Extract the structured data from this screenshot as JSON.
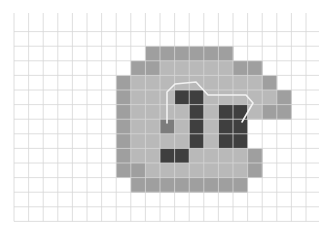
{
  "figure": {
    "grid": {
      "origin_x": 14,
      "origin_y": 17,
      "cell_size": 14.6,
      "cols": 21,
      "rows": 14,
      "line_color": "#d6d6d6"
    },
    "colors": {
      "outer": "#9f9f9f",
      "inner": "#b9b9b9",
      "dark": "#3f3f3f",
      "mid": "#7c7c7c",
      "path": "#f2f2f2"
    },
    "shape_rows": [
      {
        "row": 2,
        "cells": "......OOOOOO......."
      },
      {
        "row": 3,
        "cells": ".....OOIIIIIOO....."
      },
      {
        "row": 4,
        "cells": "....OIIIIIIIIIO...."
      },
      {
        "row": 5,
        "cells": "....OIIIDDIIIIIO..."
      },
      {
        "row": 6,
        "cells": "....OIIIIDIDDIOO..."
      },
      {
        "row": 7,
        "cells": "....OIIMIDIDD......"
      },
      {
        "row": 8,
        "cells": "....OIIIIDIDD......"
      },
      {
        "row": 9,
        "cells": "....OIIDDIIIIO....."
      },
      {
        "row": 10,
        "cells": "....OOIIIIIIIO....."
      },
      {
        "row": 11,
        "cells": ".....OOOOOOOO......"
      }
    ],
    "col_offset": 3,
    "path_points": [
      [
        167,
        123
      ],
      [
        167,
        92
      ],
      [
        175,
        84
      ],
      [
        196,
        82
      ],
      [
        208,
        95
      ],
      [
        246,
        95
      ],
      [
        253,
        103
      ],
      [
        242,
        122
      ]
    ]
  }
}
